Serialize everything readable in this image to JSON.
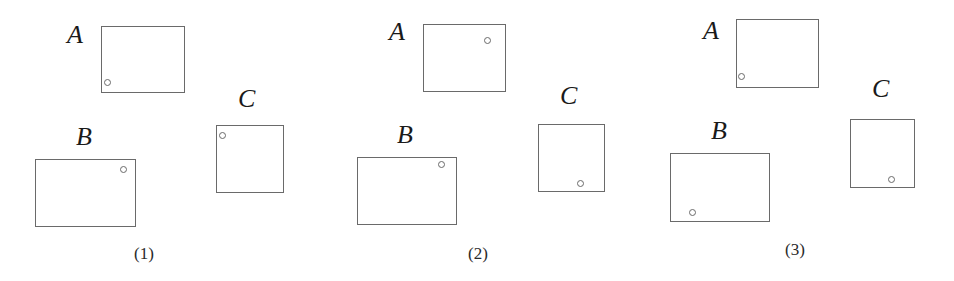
{
  "panels": [
    {
      "caption": "(1)",
      "caption_pos": [
        134,
        244
      ],
      "items": [
        {
          "label": "A",
          "label_pos": [
            67,
            22
          ],
          "rect": [
            101,
            26,
            84,
            67
          ],
          "dot": [
            108,
            83
          ]
        },
        {
          "label": "B",
          "label_pos": [
            76,
            124
          ],
          "rect": [
            35,
            159,
            101,
            68
          ],
          "dot": [
            124,
            170
          ]
        },
        {
          "label": "C",
          "label_pos": [
            238,
            86
          ],
          "rect": [
            216,
            125,
            68,
            68
          ],
          "dot": [
            223,
            136
          ]
        }
      ]
    },
    {
      "caption": "(2)",
      "caption_pos": [
        468,
        244
      ],
      "items": [
        {
          "label": "A",
          "label_pos": [
            389,
            19
          ],
          "rect": [
            423,
            24,
            83,
            68
          ],
          "dot": [
            488,
            41
          ]
        },
        {
          "label": "B",
          "label_pos": [
            397,
            122
          ],
          "rect": [
            357,
            157,
            100,
            68
          ],
          "dot": [
            442,
            165
          ]
        },
        {
          "label": "C",
          "label_pos": [
            560,
            83
          ],
          "rect": [
            538,
            124,
            67,
            68
          ],
          "dot": [
            581,
            184
          ]
        }
      ]
    },
    {
      "caption": "(3)",
      "caption_pos": [
        785,
        240
      ],
      "items": [
        {
          "label": "A",
          "label_pos": [
            703,
            18
          ],
          "rect": [
            736,
            19,
            83,
            69
          ],
          "dot": [
            742,
            77
          ]
        },
        {
          "label": "B",
          "label_pos": [
            711,
            118
          ],
          "rect": [
            670,
            153,
            100,
            69
          ],
          "dot": [
            693,
            213
          ]
        },
        {
          "label": "C",
          "label_pos": [
            872,
            76
          ],
          "rect": [
            850,
            119,
            65,
            69
          ],
          "dot": [
            892,
            180
          ]
        }
      ]
    }
  ]
}
